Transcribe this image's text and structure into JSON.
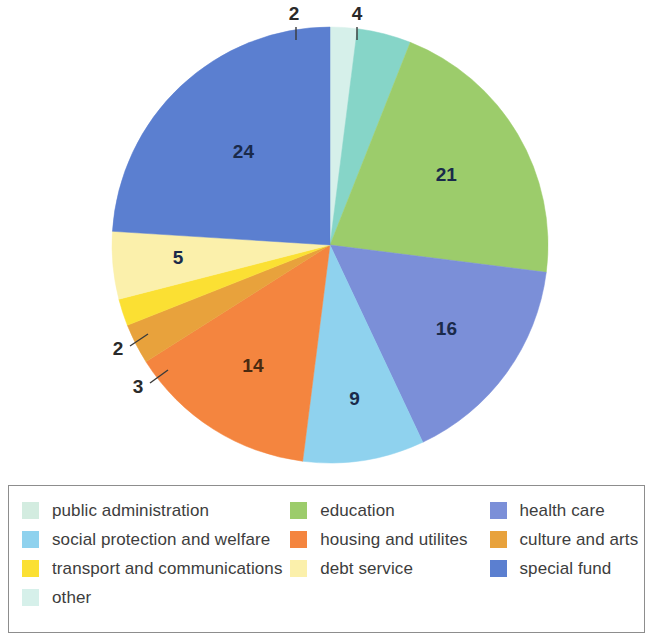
{
  "chart_data": {
    "type": "pie",
    "title": "",
    "subtitle": "",
    "units": "percent",
    "total": 100,
    "legend_position": "bottom",
    "grid": false,
    "start_angle_deg": 0,
    "direction": "clockwise",
    "categories": [
      "other",
      "public administration",
      "education",
      "health care",
      "social protection and welfare",
      "housing and utilites",
      "culture and arts",
      "transport and communications",
      "debt service",
      "special fund"
    ],
    "values": [
      2,
      4,
      21,
      16,
      9,
      14,
      3,
      2,
      5,
      24
    ],
    "colors": [
      "#d6f0ea",
      "#86d5c8",
      "#9ccc6b",
      "#7b8fd8",
      "#8fd2ee",
      "#f4853f",
      "#e8a23c",
      "#fbe033",
      "#fbf0ab",
      "#5b7fd0"
    ],
    "label_placement": [
      "callout",
      "callout",
      "inside",
      "inside",
      "inside",
      "inside",
      "callout",
      "callout",
      "inside",
      "inside"
    ],
    "slices": [
      {
        "label": "other",
        "value": 2,
        "color": "#d6f0ea"
      },
      {
        "label": "public administration",
        "value": 4,
        "color": "#86d5c8"
      },
      {
        "label": "education",
        "value": 21,
        "color": "#9ccc6b"
      },
      {
        "label": "health care",
        "value": 16,
        "color": "#7b8fd8"
      },
      {
        "label": "social protection and welfare",
        "value": 9,
        "color": "#8fd2ee"
      },
      {
        "label": "housing and utilites",
        "value": 14,
        "color": "#f4853f"
      },
      {
        "label": "culture and arts",
        "value": 3,
        "color": "#e8a23c"
      },
      {
        "label": "transport and communications",
        "value": 2,
        "color": "#fbe033"
      },
      {
        "label": "debt service",
        "value": 5,
        "color": "#fbf0ab"
      },
      {
        "label": "special fund",
        "value": 24,
        "color": "#5b7fd0"
      }
    ]
  },
  "pie": {
    "labels": {
      "other": "2",
      "public_administration": "4",
      "education": "21",
      "health_care": "16",
      "social_protection": "9",
      "housing": "14",
      "culture": "3",
      "transport": "2",
      "debt_service": "5",
      "special_fund": "24"
    }
  },
  "legend": {
    "rows": [
      [
        {
          "label": "public administration",
          "color": "#d3ece0"
        },
        {
          "label": "education",
          "color": "#9ccc6b"
        },
        {
          "label": "health care",
          "color": "#7b8fd8"
        }
      ],
      [
        {
          "label": "social protection and welfare",
          "color": "#8fd2ee"
        },
        {
          "label": "housing and utilites",
          "color": "#f4853f"
        },
        {
          "label": "culture and arts",
          "color": "#e8a23c"
        }
      ],
      [
        {
          "label": "transport and communications",
          "color": "#fbe033"
        },
        {
          "label": "debt service",
          "color": "#fbf0ab"
        },
        {
          "label": "special fund",
          "color": "#5b7fd0"
        }
      ],
      [
        {
          "label": "other",
          "color": "#d6f0ea"
        }
      ]
    ]
  }
}
